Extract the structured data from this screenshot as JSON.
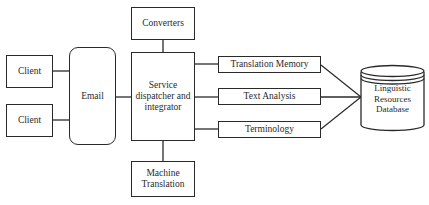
{
  "diagram": {
    "nodes": {
      "converters": "Converters",
      "client_1": "Client",
      "client_2": "Client",
      "email": "Email",
      "dispatcher_line1": "Service",
      "dispatcher_line2": "dispatcher and",
      "dispatcher_line3": "integrator",
      "machine_translation_line1": "Machine",
      "machine_translation_line2": "Translation",
      "translation_memory": "Translation Memory",
      "text_analysis": "Text Analysis",
      "terminology": "Terminology",
      "database_line1": "Linguistic",
      "database_line2": "Resources",
      "database_line3": "Database"
    },
    "edges": [
      [
        "Client",
        "Email"
      ],
      [
        "Client",
        "Email"
      ],
      [
        "Email",
        "Service dispatcher and integrator"
      ],
      [
        "Converters",
        "Service dispatcher and integrator"
      ],
      [
        "Service dispatcher and integrator",
        "Machine Translation"
      ],
      [
        "Service dispatcher and integrator",
        "Translation Memory"
      ],
      [
        "Service dispatcher and integrator",
        "Text Analysis"
      ],
      [
        "Service dispatcher and integrator",
        "Terminology"
      ],
      [
        "Translation Memory",
        "Linguistic Resources Database"
      ],
      [
        "Text Analysis",
        "Linguistic Resources Database"
      ],
      [
        "Terminology",
        "Linguistic Resources Database"
      ]
    ]
  }
}
